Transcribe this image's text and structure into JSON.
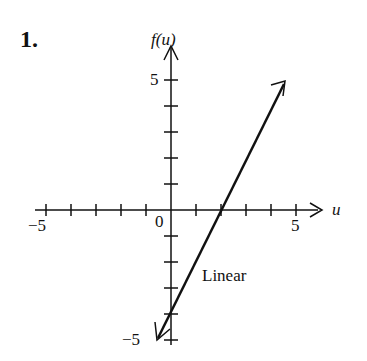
{
  "problem_number": "1.",
  "chart_data": {
    "type": "line",
    "title": "",
    "xlabel": "u",
    "ylabel": "f(u)",
    "xlim": [
      -5,
      6
    ],
    "ylim": [
      -5,
      6
    ],
    "x_ticks": [
      -5,
      -4,
      -3,
      -2,
      -1,
      0,
      1,
      2,
      3,
      4,
      5
    ],
    "y_ticks": [
      -5,
      -4,
      -3,
      -2,
      -1,
      0,
      1,
      2,
      3,
      4,
      5
    ],
    "tick_labels": {
      "x": [
        "-5",
        "0",
        "5"
      ],
      "y": [
        "5",
        "-5"
      ]
    },
    "grid": false,
    "series": [
      {
        "name": "Linear",
        "x": [
          -0.5,
          4.5
        ],
        "y": [
          -5,
          5
        ],
        "equation": "f(u)=2u-4"
      }
    ],
    "annotations": [
      "Linear"
    ]
  },
  "labels": {
    "ylab": "f(u)",
    "xlab": "u",
    "x_neg5": "−5",
    "x_0": "0",
    "x_5": "5",
    "y_5": "5",
    "y_neg5": "−5",
    "series": "Linear"
  }
}
